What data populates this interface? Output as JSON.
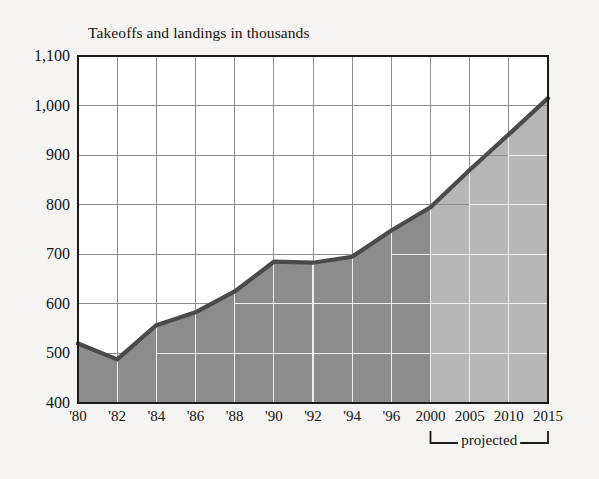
{
  "chart_data": {
    "type": "area",
    "title": "Takeoffs and landings in thousands",
    "xlabel": "",
    "ylabel": "",
    "ylim": [
      400,
      1100
    ],
    "ytick_values": [
      400,
      500,
      600,
      700,
      800,
      900,
      1000,
      1100
    ],
    "ytick_labels": [
      "400",
      "500",
      "600",
      "700",
      "800",
      "900",
      "1,000",
      "1,100"
    ],
    "categories": [
      "'80",
      "'82",
      "'84",
      "'86",
      "'88",
      "'90",
      "'92",
      "'94",
      "'96",
      "2000",
      "2005",
      "2010",
      "2015"
    ],
    "values": [
      520,
      488,
      557,
      583,
      625,
      685,
      683,
      695,
      748,
      795,
      870,
      942,
      1015
    ],
    "grid": true,
    "legend": "none",
    "annotations": [
      {
        "text": "projected",
        "from_category": "2000",
        "to_category": "2015",
        "style": "bracket-below-axis"
      }
    ],
    "series_fill_segments": [
      {
        "name": "historical",
        "from_category": "'80",
        "to_category": "2000",
        "color": "#8c8c8c"
      },
      {
        "name": "projected",
        "from_category": "2000",
        "to_category": "2015",
        "color": "#b6b6b6"
      }
    ],
    "line_color": "#4a4a4a",
    "plot_background": "#ffffff",
    "grid_color": "#8d8d8d",
    "axis_color": "#1a1a1a",
    "page_background": "#f5f4f2"
  },
  "axis": {
    "y_labels": [
      "1,100",
      "1,000",
      "900",
      "800",
      "700",
      "600",
      "500",
      "400"
    ],
    "x_labels": [
      "'80",
      "'82",
      "'84",
      "'86",
      "'88",
      "'90",
      "'92",
      "'94",
      "'96",
      "2000",
      "2005",
      "2010",
      "2015"
    ]
  },
  "annotation": {
    "projected_label": "projected"
  }
}
